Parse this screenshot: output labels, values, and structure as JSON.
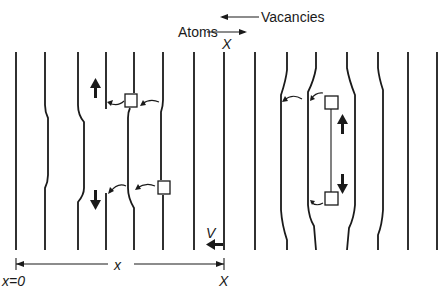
{
  "labels": {
    "vacancies": "Vacancies",
    "atoms": "Atoms",
    "flux_symbol": "X",
    "velocity": "V",
    "distance": "x",
    "origin": "x=0",
    "end": "X"
  },
  "colors": {
    "ink": "#1a1a1a",
    "background": "#ffffff"
  },
  "legend": {
    "vacancy_direction": "left",
    "atom_direction": "right"
  },
  "planes": {
    "left_group_count": 9,
    "right_group_count": 6
  },
  "markers": {
    "vacancy_squares": 4,
    "motion_arrows": [
      "up",
      "down",
      "up",
      "down",
      "left"
    ]
  }
}
